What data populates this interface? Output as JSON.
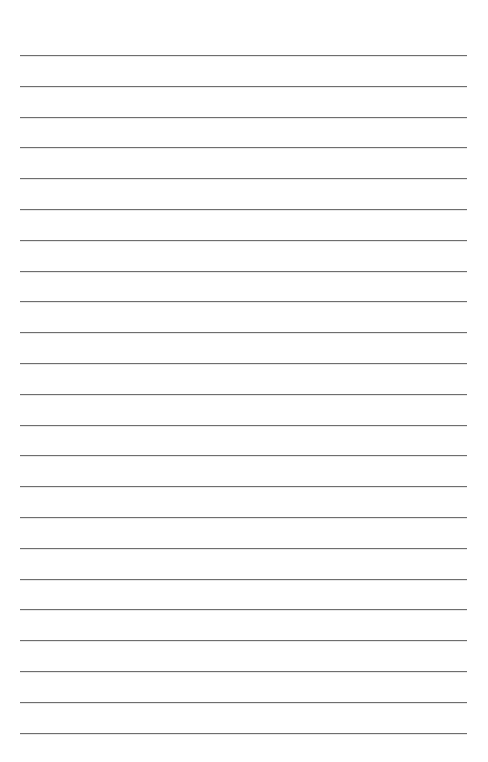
{
  "page": {
    "type": "lined-paper",
    "background_color": "#ffffff",
    "line_color": "#6e6e6e",
    "line_count": 23,
    "first_line_y": 55,
    "line_spacing": 30.8,
    "line_left": 20,
    "line_width": 447
  }
}
